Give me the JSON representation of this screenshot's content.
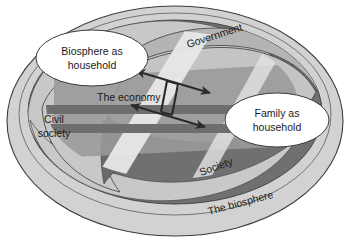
{
  "diagram": {
    "callouts": [
      {
        "id": "biosphere-as-household",
        "line1": "Biosphere as",
        "line2": "household"
      },
      {
        "id": "family-as-household",
        "line1": "Family as",
        "line2": "household"
      }
    ],
    "rings": [
      {
        "id": "the-biosphere",
        "label": "The biosphere"
      },
      {
        "id": "society",
        "label": "Society"
      },
      {
        "id": "government",
        "label": "Government"
      },
      {
        "id": "civil-society",
        "line1": "Civil",
        "line2": "society"
      }
    ],
    "core": {
      "id": "the-economy",
      "label": "The economy"
    },
    "colors": {
      "outline": "#3c3c3c",
      "biosphere_fill": "#d2d2d2",
      "society_fill": "#707070",
      "government_fill": "#b4b4b4",
      "civil_fill": "#c8c8c8",
      "economy_band": "#6e6e6e",
      "economy_panel": "#9a9a9a",
      "highlight_stripe": "#e6e6e6",
      "callout_fill": "#ffffff",
      "arrow": "#2a2a2a",
      "text": "#1a1a1a",
      "background": "#ffffff"
    }
  }
}
